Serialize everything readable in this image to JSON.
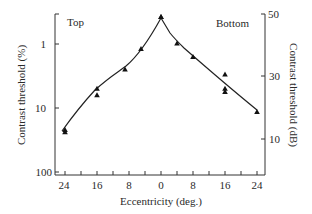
{
  "chart_data": {
    "type": "scatter",
    "title": "",
    "xlabel": "Eccentricity (deg.)",
    "ylabel": "Contrast threshold (%)",
    "ylabel_right": "Contrast threshold (dB)",
    "x_tick_labels": [
      "24",
      "16",
      "8",
      "0",
      "8",
      "16",
      "24"
    ],
    "x_ticks_deg": [
      -24,
      -20,
      -16,
      -12,
      -8,
      -4,
      0,
      4,
      8,
      12,
      16,
      20,
      24
    ],
    "y_left_tick_labels": [
      "1",
      "10",
      "100"
    ],
    "y_left_scale": "log (inverted)",
    "y_right_tick_labels": [
      "50",
      "30",
      "10"
    ],
    "region_labels": {
      "left": "Top",
      "right": "Bottom"
    },
    "grid": false,
    "series": [
      {
        "name": "Top (upper visual field)",
        "marker": "triangle",
        "points": [
          {
            "ecc": 24,
            "threshold_pct": 24
          },
          {
            "ecc": 24,
            "threshold_pct": 22
          },
          {
            "ecc": 16,
            "threshold_pct": 6.3
          },
          {
            "ecc": 16,
            "threshold_pct": 5.0
          },
          {
            "ecc": 9,
            "threshold_pct": 2.5
          },
          {
            "ecc": 5,
            "threshold_pct": 1.2
          },
          {
            "ecc": 0,
            "threshold_pct": 0.38
          }
        ]
      },
      {
        "name": "Bottom (lower visual field)",
        "marker": "triangle",
        "points": [
          {
            "ecc": 0,
            "threshold_pct": 0.38
          },
          {
            "ecc": 4,
            "threshold_pct": 0.98
          },
          {
            "ecc": 8,
            "threshold_pct": 1.6
          },
          {
            "ecc": 16,
            "threshold_pct": 3.0
          },
          {
            "ecc": 16,
            "threshold_pct": 5.0
          },
          {
            "ecc": 16,
            "threshold_pct": 5.6
          },
          {
            "ecc": 24,
            "threshold_pct": 11.5
          }
        ]
      }
    ]
  }
}
